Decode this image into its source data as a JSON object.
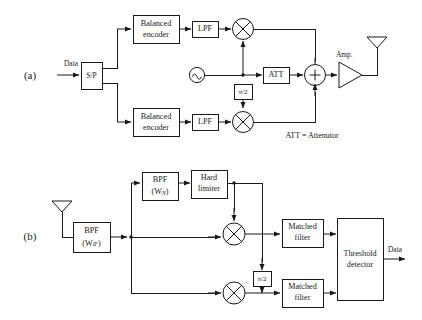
{
  "figure": {
    "panels": [
      {
        "id": "a",
        "label": "(a)",
        "caption": "Transmitter"
      },
      {
        "id": "b",
        "label": "(b)",
        "caption": "Receiver"
      }
    ],
    "colors": {
      "line": "#1a1a1a",
      "background": "#ffffff",
      "fill": "#ffffff"
    }
  },
  "panel_a": {
    "label": "(a)",
    "input_label": "Data",
    "sp_block": "S/P",
    "encoder_top": {
      "line1": "Balanced",
      "line2": "encoder"
    },
    "encoder_bottom": {
      "line1": "Balanced",
      "line2": "encoder"
    },
    "lpf_top": "LPF",
    "lpf_bottom": "LPF",
    "oscillator": "oscillator-icon",
    "phase_shift": "π/2",
    "attenuator": "ATT",
    "summer": "+",
    "mixer_top": "mixer-symbol",
    "mixer_bottom": "mixer-symbol",
    "amplifier_label": "Amp.",
    "antenna": "antenna-icon",
    "legend_note": "ATT = Attenutor"
  },
  "panel_b": {
    "label": "(b)",
    "antenna": "antenna-icon",
    "bpf_if": {
      "line1": "BPF",
      "line2_prefix": "(W",
      "line2_sub": "IF",
      "line2_suffix": ")"
    },
    "bpf_n": {
      "line1": "BPF",
      "line2_prefix": "(W",
      "line2_sub": "N",
      "line2_suffix": ")"
    },
    "hard_limiter": {
      "line1": "Hard",
      "line2": "limiter"
    },
    "phase_shift": "π/2",
    "mixer_top": "mixer-symbol",
    "mixer_bottom": "mixer-symbol",
    "matched_filter_top": {
      "line1": "Matched",
      "line2": "filter"
    },
    "matched_filter_bottom": {
      "line1": "Matched",
      "line2": "filter"
    },
    "threshold_detector": {
      "line1": "Threshold",
      "line2": "detector"
    },
    "output_label": "Data"
  }
}
